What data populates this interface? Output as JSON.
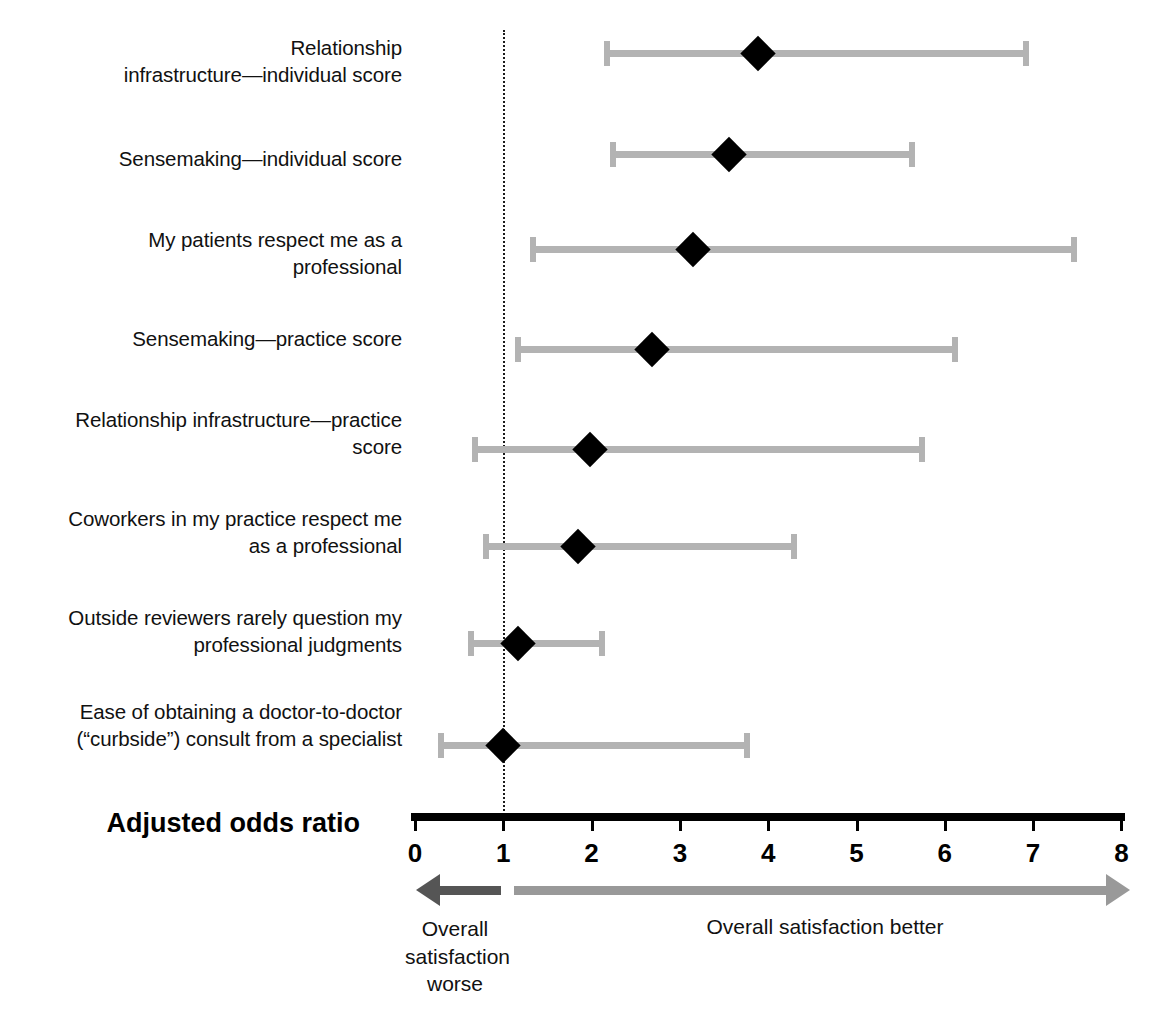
{
  "chart_data": {
    "type": "forest",
    "title": "",
    "xlabel": "Adjusted odds ratio",
    "ylabel": "",
    "xlim": [
      0,
      8
    ],
    "xticks": [
      "0",
      "1",
      "2",
      "3",
      "4",
      "5",
      "6",
      "7",
      "8"
    ],
    "grid": false,
    "reference_line": 1,
    "legend_position": "below-axis",
    "categories": [
      "Relationship\ninfrastructure—individual score",
      "Sensemaking—individual score",
      "My patients respect me as a\nprofessional",
      "Sensemaking—practice score",
      "Relationship infrastructure—practice\nscore",
      "Coworkers in my practice respect me\nas a professional",
      "Outside reviewers rarely question my\nprofessional judgments",
      "Ease of obtaining a doctor-to-doctor\n(“curbside”) consult from a specialist"
    ],
    "values": [
      3.88,
      3.56,
      3.15,
      2.68,
      1.98,
      1.85,
      1.17,
      1.0
    ],
    "ci_low": [
      2.15,
      2.22,
      1.31,
      1.14,
      0.66,
      0.78,
      0.61,
      0.27
    ],
    "ci_high": [
      6.94,
      5.65,
      7.49,
      6.14,
      5.76,
      4.31,
      2.14,
      3.78
    ],
    "rows": [
      {
        "label": "Relationship\ninfrastructure—individual score",
        "estimate": 3.88,
        "low": 2.15,
        "high": 6.94
      },
      {
        "label": "Sensemaking—individual score",
        "estimate": 3.56,
        "low": 2.22,
        "high": 5.65
      },
      {
        "label": "My patients respect me as a\nprofessional",
        "estimate": 3.15,
        "low": 1.31,
        "high": 7.49
      },
      {
        "label": "Sensemaking—practice score",
        "estimate": 2.68,
        "low": 1.14,
        "high": 6.14
      },
      {
        "label": "Relationship infrastructure—practice\nscore",
        "estimate": 1.98,
        "low": 0.66,
        "high": 5.76
      },
      {
        "label": "Coworkers in my practice respect me\nas a professional",
        "estimate": 1.85,
        "low": 0.78,
        "high": 4.31
      },
      {
        "label": "Outside reviewers rarely question my\nprofessional judgments",
        "estimate": 1.17,
        "low": 0.61,
        "high": 2.14
      },
      {
        "label": "Ease of obtaining a doctor-to-doctor\n(“curbside”) consult from a specialist",
        "estimate": 1.0,
        "low": 0.27,
        "high": 3.78
      }
    ],
    "annotations": {
      "left_arrow_caption": "Overall\nsatisfaction\nworse",
      "right_arrow_caption": "Overall satisfaction better"
    },
    "colors": {
      "interval": "#b3b3b3",
      "point": "#000000",
      "axis": "#000000",
      "reference_line": "#1a1a1a",
      "left_arrow": "#555555",
      "right_arrow": "#999999",
      "text": "#111111",
      "background": "#ffffff"
    }
  },
  "axis": {
    "title": "Adjusted odds ratio",
    "ticks": [
      "0",
      "1",
      "2",
      "3",
      "4",
      "5",
      "6",
      "7",
      "8"
    ]
  },
  "legend": {
    "worse": "Overall\nsatisfaction\nworse",
    "better": "Overall satisfaction better"
  }
}
